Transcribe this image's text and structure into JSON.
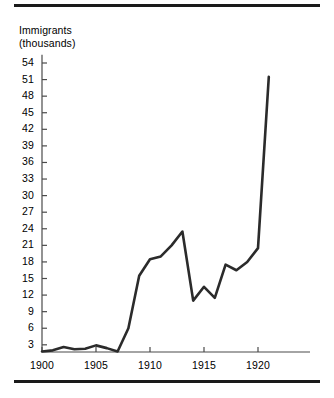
{
  "figure": {
    "y_axis_title_line1": "Immigrants",
    "y_axis_title_line2": "(thousands)",
    "line_color": "#2b2b2b",
    "axis_color": "#4a4a4a",
    "rule_color": "#1a1a1a"
  },
  "chart_data": {
    "type": "line",
    "title": "",
    "subtitle": "",
    "xlabel": "",
    "ylabel": "Immigrants (thousands)",
    "grid": false,
    "legend": "none",
    "xlim": [
      1900,
      1922
    ],
    "ylim": [
      1.7,
      55.5
    ],
    "x_ticks": [
      1900,
      1905,
      1910,
      1915,
      1920
    ],
    "x_tick_labels": [
      "1900",
      "1905",
      "1910",
      "1915",
      "1920"
    ],
    "x_minor_tick_interval": 5,
    "y_ticks": [
      3,
      6,
      9,
      12,
      15,
      18,
      21,
      24,
      27,
      30,
      33,
      36,
      39,
      42,
      45,
      48,
      51,
      54
    ],
    "y_tick_labels": [
      "3",
      "6",
      "9",
      "12",
      "15",
      "18",
      "21",
      "24",
      "27",
      "30",
      "33",
      "36",
      "39",
      "42",
      "45",
      "48",
      "51",
      "54"
    ],
    "series": [
      {
        "name": "Immigrants",
        "x": [
          1900,
          1901,
          1902,
          1903,
          1904,
          1905,
          1906,
          1907,
          1908,
          1909,
          1910,
          1911,
          1912,
          1913,
          1914,
          1915,
          1916,
          1917,
          1918,
          1919,
          1920,
          1921
        ],
        "values": [
          1.8,
          2.0,
          2.6,
          2.2,
          2.3,
          2.9,
          2.4,
          1.8,
          6.0,
          15.5,
          18.5,
          19.0,
          21.0,
          23.5,
          11.0,
          13.5,
          11.5,
          17.5,
          16.5,
          18.0,
          20.5,
          51.5
        ]
      }
    ]
  }
}
